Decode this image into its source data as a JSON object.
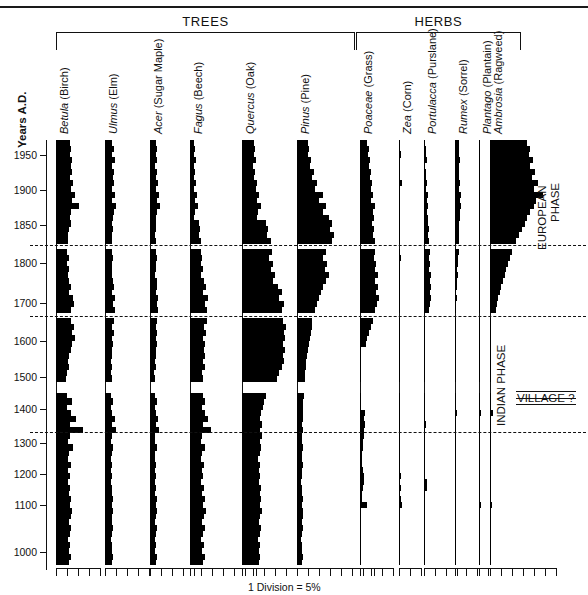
{
  "figure": {
    "groups": [
      {
        "label": "TREES",
        "left": 56,
        "right": 355
      },
      {
        "label": "HERBS",
        "left": 356,
        "right": 521
      }
    ],
    "yaxis_title": "Years A.D.",
    "scale_caption": "1 Division = 5%",
    "annotations": [
      {
        "name": "european-phase",
        "text": "EUROPEAN\nPHASE",
        "line1": "EUROPEAN",
        "line2": "PHASE"
      },
      {
        "name": "indian-phase",
        "text": "INDIAN PHASE"
      },
      {
        "name": "village-marker",
        "text": "VILLAGE ?"
      }
    ]
  },
  "chart_data": {
    "type": "area",
    "title": "",
    "subtitle": "",
    "xlabel": "1 Division = 5%",
    "ylabel": "Years A.D.",
    "orientation": "horizontal-stratigraphic",
    "division_percent": 5,
    "grid": false,
    "legend": "none",
    "ylim": [
      1000,
      1990
    ],
    "ytick_labels": [
      "1950",
      "1900",
      "1850",
      "1800",
      "1700",
      "1600",
      "1500",
      "1400",
      "1300",
      "1200",
      "1100",
      "1000"
    ],
    "ytick_values": [
      1950,
      1900,
      1850,
      1800,
      1700,
      1600,
      1500,
      1400,
      1300,
      1200,
      1100,
      1000
    ],
    "ytick_pixel_y": [
      155,
      190,
      225,
      263,
      303,
      341,
      377,
      409,
      443,
      474,
      505,
      552
    ],
    "horizon_lines": [
      {
        "name": "european-contact",
        "approx_year": 1770,
        "pixel_y": 245
      },
      {
        "name": "mid-horizon",
        "approx_year": 1665,
        "pixel_y": 316
      },
      {
        "name": "village-horizon",
        "approx_year": 1345,
        "pixel_y": 432
      }
    ],
    "axis_breaks_pixel_y": [
      243,
      248,
      314,
      319,
      385,
      390
    ],
    "taxa": [
      {
        "name": "Betula",
        "common": "(Birch)",
        "label_italic": "Betula",
        "label_plain": " (Birch)",
        "x": 56,
        "divisions": 4,
        "max_percent": 20,
        "values": [
          6.2,
          7.0,
          6.4,
          7.4,
          6.6,
          7.2,
          6.3,
          7.6,
          6.9,
          8.6,
          7.2,
          10.4,
          7.0,
          6.4,
          6.6,
          6.0,
          5.6,
          5.4,
          5.6,
          5.2,
          5.8,
          5.2,
          6.0,
          5.4,
          5.9,
          6.6,
          6.0,
          7.6,
          8.4,
          7.0,
          7.5,
          6.8,
          8.0,
          7.2,
          8.6,
          7.4,
          6.6,
          6.0,
          5.4,
          6.0,
          5.0,
          4.6,
          5.4,
          4.4,
          5.0,
          7.4,
          5.2,
          6.8,
          9.2,
          6.4,
          12.4,
          6.2,
          5.6,
          7.6,
          6.0,
          5.4,
          6.6,
          5.6,
          6.2,
          5.6,
          6.4,
          5.8,
          7.0,
          6.2,
          7.4,
          6.6,
          6.0,
          6.8,
          6.2,
          5.6,
          6.4,
          5.8,
          6.6,
          6.0
        ]
      },
      {
        "name": "Ulmus",
        "common": "(Elm)",
        "label_italic": "Ulmus",
        "label_plain": " (Elm)",
        "x": 105,
        "divisions": 4,
        "max_percent": 20,
        "values": [
          3.2,
          4.0,
          3.4,
          4.4,
          3.0,
          4.2,
          3.6,
          4.0,
          3.2,
          4.6,
          3.4,
          5.0,
          4.0,
          3.6,
          3.2,
          3.6,
          3.0,
          3.4,
          2.8,
          3.2,
          3.8,
          3.2,
          3.4,
          3.0,
          3.6,
          4.2,
          3.4,
          4.6,
          3.8,
          4.4,
          3.6,
          4.2,
          3.4,
          4.0,
          3.2,
          3.8,
          3.2,
          3.4,
          2.8,
          3.4,
          2.6,
          3.0,
          2.8,
          2.4,
          2.8,
          3.6,
          2.8,
          3.4,
          4.4,
          3.2,
          5.2,
          3.0,
          2.8,
          3.8,
          3.0,
          2.6,
          3.4,
          2.8,
          3.2,
          2.8,
          3.4,
          3.0,
          3.6,
          3.2,
          3.8,
          3.4,
          3.0,
          3.6,
          3.2,
          2.8,
          3.4,
          3.0,
          3.6,
          3.2
        ]
      },
      {
        "name": "Acer",
        "common": "(Sugar Maple)",
        "label_italic": "Acer",
        "label_plain": " (Sugar Maple)",
        "x": 150,
        "divisions": 4,
        "max_percent": 20,
        "values": [
          2.6,
          3.2,
          2.8,
          3.4,
          2.4,
          3.0,
          2.6,
          3.6,
          2.8,
          4.0,
          3.0,
          4.4,
          3.2,
          2.8,
          2.6,
          2.8,
          2.4,
          2.8,
          2.2,
          2.6,
          3.0,
          2.6,
          2.8,
          2.4,
          3.0,
          3.4,
          2.8,
          3.8,
          3.2,
          3.6,
          3.0,
          3.4,
          2.8,
          3.2,
          2.6,
          3.0,
          2.6,
          2.8,
          2.2,
          2.8,
          2.0,
          2.4,
          2.2,
          2.0,
          2.4,
          3.0,
          2.4,
          2.8,
          3.6,
          2.6,
          4.2,
          2.4,
          2.2,
          3.0,
          2.4,
          2.2,
          2.8,
          2.4,
          2.6,
          2.2,
          2.8,
          2.4,
          3.0,
          2.6,
          3.2,
          2.8,
          2.4,
          3.0,
          2.6,
          2.2,
          2.8,
          2.4,
          3.0,
          2.6
        ]
      },
      {
        "name": "Fagus",
        "common": "(Beech)",
        "label_italic": "Fagus",
        "label_plain": " (Beech)",
        "x": 190,
        "divisions": 6,
        "max_percent": 30,
        "values": [
          1.8,
          2.4,
          2.0,
          2.6,
          1.6,
          2.2,
          1.8,
          2.8,
          2.0,
          3.2,
          2.2,
          3.6,
          2.4,
          2.0,
          4.0,
          4.6,
          4.0,
          5.2,
          4.4,
          5.0,
          5.6,
          5.0,
          6.0,
          5.2,
          6.4,
          7.2,
          6.0,
          8.0,
          7.0,
          7.8,
          6.8,
          7.6,
          6.4,
          7.4,
          6.0,
          7.0,
          6.2,
          6.6,
          5.8,
          6.6,
          5.4,
          6.0,
          5.6,
          5.0,
          5.8,
          7.0,
          5.6,
          6.6,
          8.4,
          6.0,
          9.6,
          5.6,
          5.2,
          7.0,
          5.6,
          5.0,
          6.4,
          5.4,
          6.0,
          5.2,
          6.4,
          5.6,
          6.8,
          6.0,
          7.2,
          6.4,
          5.6,
          6.8,
          6.0,
          5.2,
          6.4,
          5.6,
          6.8,
          6.0
        ]
      },
      {
        "name": "Quercus",
        "common": "(Oak)",
        "label_italic": "Quercus",
        "label_plain": " (Oak)",
        "x": 242,
        "divisions": 7,
        "max_percent": 35,
        "values": [
          5.4,
          6.0,
          5.6,
          6.4,
          5.2,
          6.0,
          5.6,
          6.8,
          6.2,
          7.6,
          6.6,
          8.8,
          7.4,
          6.8,
          11.0,
          12.0,
          11.2,
          13.0,
          12.0,
          13.6,
          12.4,
          14.0,
          13.0,
          15.0,
          14.0,
          16.4,
          18.0,
          17.0,
          19.0,
          18.2,
          19.6,
          18.6,
          20.0,
          19.0,
          19.6,
          18.8,
          19.4,
          18.6,
          19.0,
          18.0,
          17.0,
          16.0,
          14.0,
          13.0,
          11.0,
          10.2,
          9.4,
          8.6,
          8.0,
          9.2,
          8.4,
          9.0,
          8.2,
          8.8,
          8.0,
          7.4,
          8.2,
          7.6,
          8.4,
          7.8,
          8.6,
          8.0,
          8.8,
          8.2,
          9.0,
          8.4,
          7.8,
          8.6,
          8.0,
          7.4,
          8.2,
          7.6,
          8.4,
          7.8
        ]
      },
      {
        "name": "Pinus",
        "common": "(Pine)",
        "label_italic": "Pinus",
        "label_plain": " (Pine)",
        "x": 297,
        "divisions": 7,
        "max_percent": 35,
        "values": [
          5.0,
          5.6,
          5.2,
          6.4,
          5.8,
          7.6,
          6.8,
          9.2,
          8.4,
          11.6,
          10.0,
          13.4,
          12.0,
          14.6,
          16.0,
          15.0,
          17.0,
          16.0,
          14.0,
          13.0,
          12.0,
          13.6,
          12.6,
          14.4,
          13.4,
          12.0,
          11.0,
          10.0,
          9.0,
          8.0,
          7.4,
          7.0,
          6.6,
          6.2,
          5.8,
          5.4,
          5.0,
          4.6,
          4.2,
          4.0,
          3.8,
          3.6,
          3.4,
          3.2,
          3.0,
          2.8,
          2.6,
          2.8,
          2.6,
          2.4,
          2.6,
          2.4,
          2.2,
          2.6,
          2.4,
          2.2,
          2.6,
          2.4,
          2.2,
          2.0,
          2.4,
          2.2,
          2.6,
          2.4,
          2.8,
          2.6,
          2.2,
          2.6,
          2.4,
          2.0,
          2.4,
          2.2,
          2.6,
          2.4
        ]
      },
      {
        "name": "Poaceae",
        "common": "(Grass)",
        "label_italic": "Poaceae",
        "label_plain": " (Grass)",
        "x": 360,
        "divisions": 3,
        "max_percent": 15,
        "values": [
          3.4,
          4.2,
          3.6,
          4.6,
          4.0,
          5.0,
          4.4,
          5.4,
          4.8,
          6.0,
          5.2,
          6.6,
          5.8,
          6.2,
          5.6,
          6.4,
          5.8,
          6.8,
          6.0,
          7.0,
          6.2,
          7.4,
          6.6,
          8.0,
          7.0,
          8.4,
          7.2,
          8.8,
          7.6,
          7.0,
          6.4,
          5.8,
          5.0,
          4.2,
          3.4,
          2.6,
          0.5,
          0.4,
          0.4,
          0.4,
          0.4,
          0.4,
          0.4,
          0.4,
          0.4,
          0.4,
          0.4,
          2.4,
          2.0,
          2.2,
          1.6,
          1.8,
          1.4,
          1.2,
          1.0,
          0.9,
          0.8,
          1.4,
          2.0,
          1.6,
          1.2,
          0.9,
          0.8,
          3.0,
          0.4,
          0.4,
          0.4,
          0.4,
          0.4,
          0.4,
          0.4,
          0.4,
          0.4,
          0.4
        ]
      },
      {
        "name": "Zea",
        "common": "(Corn)",
        "label_italic": "Zea",
        "label_plain": " (Corn)",
        "x": 399,
        "divisions": 2,
        "max_percent": 10,
        "values": [
          0.3,
          0.3,
          1.0,
          0.3,
          0.3,
          0.3,
          0.3,
          1.2,
          0.3,
          0.3,
          0.3,
          0.3,
          0.3,
          0.3,
          0.3,
          0.3,
          0.3,
          0.3,
          0.3,
          0.3,
          1.0,
          0.3,
          0.3,
          0.3,
          0.3,
          0.3,
          0.3,
          0.3,
          0.3,
          0.3,
          0.3,
          0.0,
          0.0,
          0.0,
          0.0,
          0.0,
          0.0,
          0.0,
          0.0,
          0.0,
          0.0,
          0.0,
          0.0,
          0.0,
          0.0,
          0.0,
          0.0,
          0.0,
          0.6,
          0.0,
          0.0,
          0.0,
          0.0,
          0.0,
          0.0,
          0.0,
          0.0,
          0.0,
          0.9,
          0.0,
          1.0,
          0.0,
          0.8,
          1.2,
          0.0,
          0.0,
          0.0,
          0.0,
          0.0,
          0.0,
          0.0,
          0.0,
          0.0,
          0.0
        ]
      },
      {
        "name": "Portulacca",
        "common": "(Purslane)",
        "label_italic": "Portulacca",
        "label_plain": " (Purslane)",
        "x": 424,
        "divisions": 3,
        "max_percent": 15,
        "values": [
          0.5,
          1.0,
          0.8,
          1.2,
          0.6,
          1.0,
          0.8,
          1.4,
          1.0,
          1.6,
          1.2,
          1.8,
          1.4,
          2.0,
          1.6,
          2.2,
          1.8,
          2.4,
          2.0,
          2.6,
          2.2,
          2.8,
          2.4,
          3.0,
          2.6,
          3.2,
          2.8,
          3.0,
          2.6,
          2.2,
          1.0,
          0.0,
          0.0,
          0.0,
          0.0,
          0.0,
          0.0,
          0.0,
          0.0,
          0.0,
          0.0,
          0.0,
          0.0,
          0.0,
          0.6,
          0.0,
          0.0,
          0.0,
          0.0,
          0.8,
          0.0,
          0.0,
          0.0,
          0.0,
          0.0,
          0.6,
          0.0,
          0.0,
          0.0,
          1.2,
          1.4,
          0.0,
          0.0,
          0.0,
          0.0,
          0.0,
          0.0,
          0.0,
          0.0,
          0.0,
          0.0,
          0.0,
          0.0,
          0.0
        ]
      },
      {
        "name": "Rumex",
        "common": "(Sorrel)",
        "label_italic": "Rumex",
        "label_plain": " (Sorrel)",
        "x": 455,
        "divisions": 3,
        "max_percent": 15,
        "values": [
          1.6,
          2.0,
          1.8,
          2.2,
          1.6,
          2.0,
          1.8,
          2.4,
          2.0,
          2.6,
          2.2,
          2.8,
          2.4,
          2.2,
          1.8,
          2.0,
          1.6,
          1.8,
          1.4,
          1.6,
          1.2,
          1.4,
          1.0,
          1.2,
          0.8,
          1.0,
          0.6,
          0.8,
          0.6,
          0.5,
          0.4,
          0.0,
          0.0,
          0.0,
          0.0,
          0.0,
          0.0,
          0.0,
          0.0,
          0.0,
          0.0,
          0.0,
          0.0,
          0.0,
          0.0,
          0.0,
          0.0,
          0.8,
          0.0,
          0.0,
          0.0,
          0.0,
          0.0,
          0.0,
          0.0,
          0.0,
          0.0,
          0.0,
          0.0,
          0.0,
          0.0,
          0.0,
          0.0,
          0.0,
          0.0,
          0.0,
          0.0,
          0.0,
          0.0,
          0.0,
          0.0,
          0.0,
          0.0,
          0.0
        ]
      },
      {
        "name": "Plantago",
        "common": "(Plantain)",
        "label_italic": "Plantago",
        "label_plain": " (Plantain)",
        "x": 479,
        "divisions": 3,
        "max_percent": 15,
        "values": [
          0.6,
          0.5,
          0.4,
          0.5,
          0.4,
          0.5,
          0.4,
          0.5,
          0.4,
          0.5,
          0.4,
          0.5,
          0.4,
          0.5,
          0.4,
          0.5,
          0.4,
          0.5,
          0.4,
          0.5,
          0.4,
          0.5,
          0.4,
          0.5,
          0.4,
          0.5,
          0.4,
          0.5,
          0.4,
          0.5,
          0.4,
          0.4,
          0.4,
          0.4,
          0.4,
          0.4,
          0.4,
          0.4,
          0.4,
          0.4,
          0.4,
          0.4,
          0.4,
          0.4,
          0.4,
          0.4,
          0.4,
          1.0,
          0.4,
          0.4,
          0.4,
          0.4,
          0.4,
          0.4,
          0.4,
          0.4,
          0.4,
          0.4,
          0.4,
          0.4,
          0.4,
          0.4,
          0.4,
          1.0,
          0.4,
          0.4,
          0.4,
          0.4,
          0.4,
          0.4,
          0.4,
          0.4,
          0.4,
          0.4
        ]
      },
      {
        "name": "Ambrosia",
        "common": "(Ragweed)",
        "label_italic": "Ambrosia",
        "label_plain": " (Ragweed)",
        "x": 490,
        "divisions": 6,
        "max_percent": 30,
        "values": [
          17.0,
          18.4,
          17.6,
          19.6,
          18.0,
          20.6,
          19.2,
          22.0,
          20.0,
          24.0,
          21.0,
          20.0,
          18.0,
          17.0,
          16.0,
          14.6,
          13.4,
          12.0,
          11.0,
          10.0,
          9.0,
          8.2,
          7.4,
          6.6,
          5.8,
          5.0,
          4.4,
          3.8,
          3.2,
          2.6,
          2.0,
          0.4,
          0.4,
          0.4,
          0.4,
          0.4,
          0.4,
          0.4,
          0.4,
          0.4,
          0.4,
          0.4,
          0.4,
          0.4,
          0.4,
          0.4,
          0.4,
          1.2,
          0.4,
          0.4,
          0.4,
          0.4,
          0.4,
          0.4,
          0.4,
          0.4,
          0.4,
          0.4,
          0.4,
          0.4,
          0.4,
          0.4,
          0.4,
          1.0,
          0.4,
          0.4,
          0.4,
          0.4,
          0.4,
          0.4,
          0.4,
          0.4,
          0.4,
          0.4
        ]
      }
    ]
  }
}
